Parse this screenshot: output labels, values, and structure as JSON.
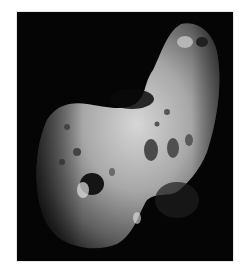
{
  "image": {
    "subject": "asteroid",
    "description": "Grayscale photograph of an elongated, cratered asteroid against a black sky",
    "colors": {
      "background": "#ffffff",
      "sky": "#050505",
      "surface_light": "#cfcfcf",
      "surface_mid": "#8a8a8a",
      "surface_dark": "#3a3a3a"
    }
  }
}
